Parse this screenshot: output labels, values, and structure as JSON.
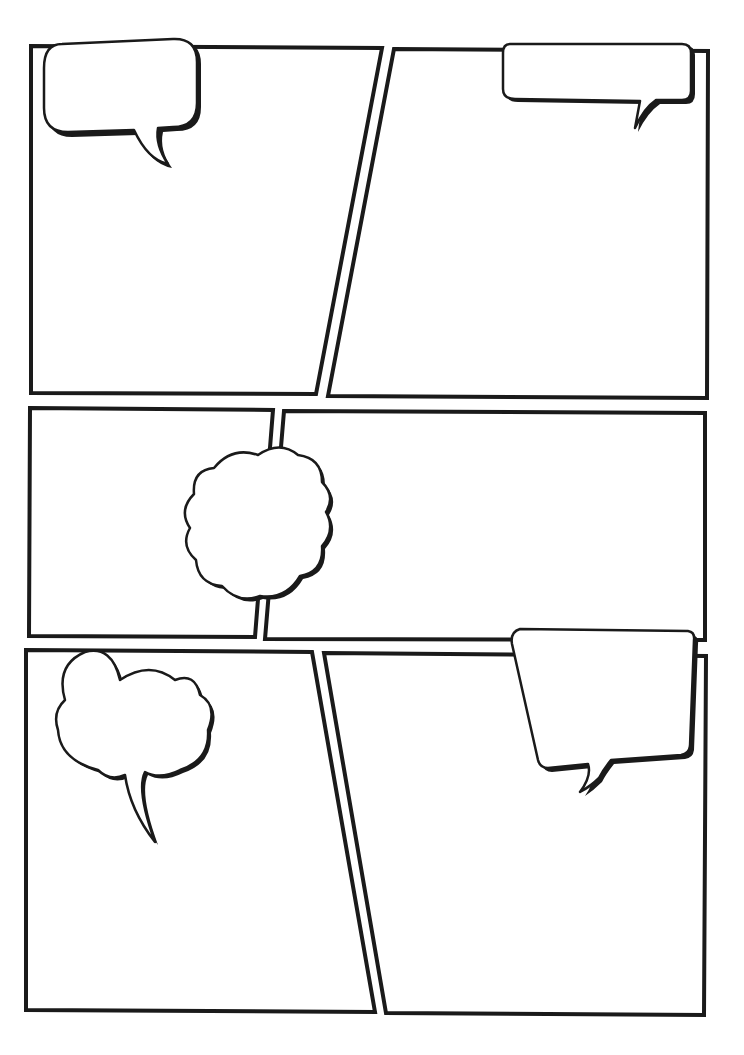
{
  "page": {
    "title": "Comic page template",
    "background": "#ffffff",
    "ink_color": "#1a1a1a"
  },
  "panels": [
    {
      "id": "panel-1",
      "position": "top-left",
      "text": ""
    },
    {
      "id": "panel-2",
      "position": "top-right",
      "text": ""
    },
    {
      "id": "panel-3",
      "position": "middle-left",
      "text": ""
    },
    {
      "id": "panel-4",
      "position": "middle-right",
      "text": ""
    },
    {
      "id": "panel-5",
      "position": "bottom-left",
      "text": ""
    },
    {
      "id": "panel-6",
      "position": "bottom-right",
      "text": ""
    }
  ],
  "bubbles": [
    {
      "id": "bubble-1",
      "type": "speech-rounded",
      "panel": "panel-1",
      "text": ""
    },
    {
      "id": "bubble-2",
      "type": "speech-rounded-wide",
      "panel": "panel-2",
      "text": ""
    },
    {
      "id": "bubble-3",
      "type": "thought-cloud-scalloped",
      "panel": "panel-3/panel-4",
      "text": ""
    },
    {
      "id": "bubble-4",
      "type": "thought-cloud-with-tail",
      "panel": "panel-5",
      "text": ""
    },
    {
      "id": "bubble-5",
      "type": "speech-trapezoid",
      "panel": "panel-6",
      "text": ""
    }
  ]
}
